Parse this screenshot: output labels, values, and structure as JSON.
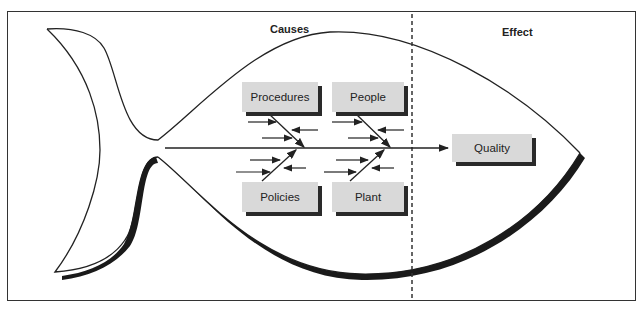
{
  "diagram": {
    "type": "fishbone",
    "section_labels": {
      "causes": "Causes",
      "effect": "Effect"
    },
    "causes": [
      {
        "label": "Procedures",
        "position": "top-left"
      },
      {
        "label": "People",
        "position": "top-right"
      },
      {
        "label": "Policies",
        "position": "bottom-left"
      },
      {
        "label": "Plant",
        "position": "bottom-right"
      }
    ],
    "effect": {
      "label": "Quality"
    },
    "colors": {
      "box_fill": "#d9d9d9",
      "box_shadow": "#2a2a2a",
      "line": "#222222"
    }
  }
}
